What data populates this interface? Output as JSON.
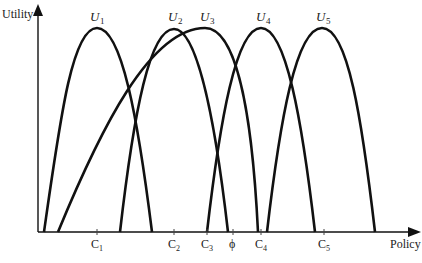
{
  "diagram": {
    "y_axis_label": "Utility",
    "x_axis_label": "Policy",
    "curves": [
      {
        "label": "U",
        "sub": "1",
        "peak_x": 97,
        "left_x": 44,
        "right_x": 152
      },
      {
        "label": "U",
        "sub": "2",
        "peak_x": 174,
        "left_x": 120,
        "right_x": 228
      },
      {
        "label": "U",
        "sub": "3",
        "peak_x": 205,
        "left_x": 58,
        "right_x": 258
      },
      {
        "label": "U",
        "sub": "4",
        "peak_x": 261,
        "left_x": 207,
        "right_x": 315
      },
      {
        "label": "U",
        "sub": "5",
        "peak_x": 322,
        "left_x": 267,
        "right_x": 375
      }
    ],
    "ticks": [
      {
        "label": "C",
        "sub": "1",
        "x": 97
      },
      {
        "label": "C",
        "sub": "2",
        "x": 174
      },
      {
        "label": "C",
        "sub": "3",
        "x": 207
      },
      {
        "label": "ϕ",
        "sub": "",
        "x": 233
      },
      {
        "label": "C",
        "sub": "4",
        "x": 261
      },
      {
        "label": "C",
        "sub": "5",
        "x": 324
      }
    ]
  }
}
